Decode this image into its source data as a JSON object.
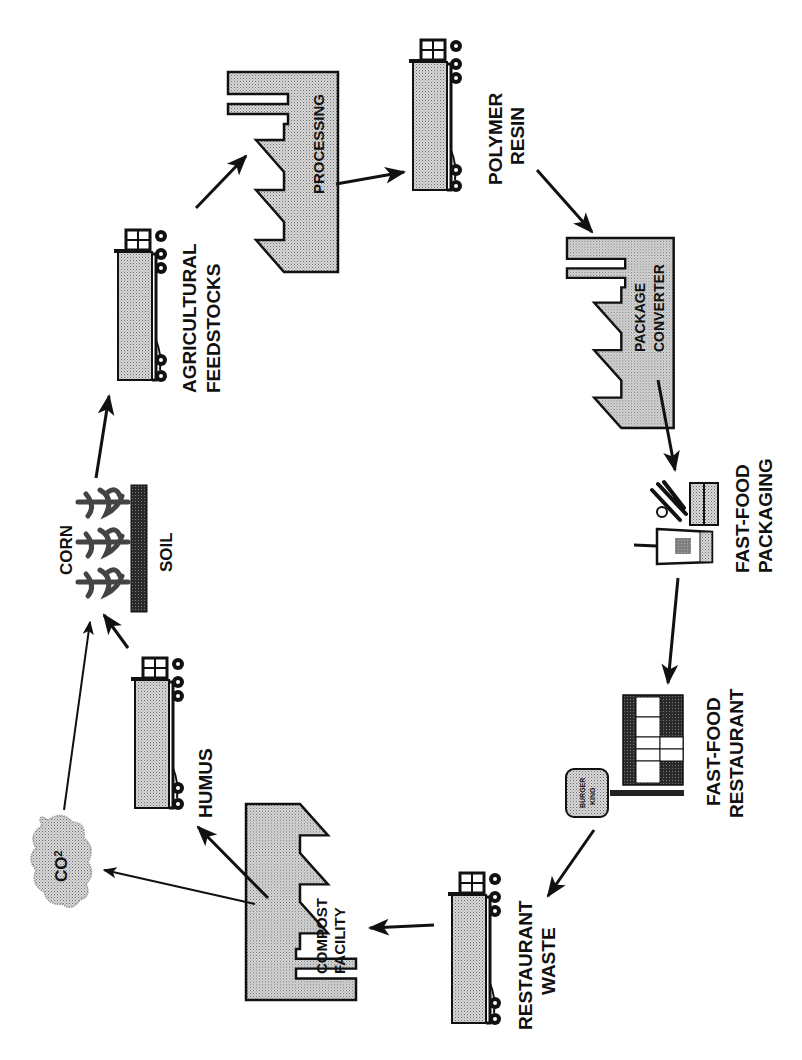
{
  "diagram": {
    "type": "cycle",
    "orientation": "rotated-90-ccw",
    "colors": {
      "stroke": "#111111",
      "fill_light": "#c8c8c8",
      "fill_dark": "#3a3a3a",
      "background": "#ffffff"
    },
    "nodes": [
      {
        "id": "corn",
        "label": "CORN",
        "icon": "corn-plants-icon"
      },
      {
        "id": "soil",
        "label": "SOIL",
        "icon": "soil-bar-icon"
      },
      {
        "id": "agricultural_feedstocks",
        "label_line1": "AGRICULTURAL",
        "label_line2": "FEEDSTOCKS",
        "icon": "truck-icon"
      },
      {
        "id": "processing",
        "label": "PROCESSING",
        "icon": "factory-icon"
      },
      {
        "id": "polymer_resin",
        "label_line1": "POLYMER",
        "label_line2": "RESIN",
        "icon": "truck-icon"
      },
      {
        "id": "package_converter",
        "label_line1": "PACKAGE",
        "label_line2": "CONVERTER",
        "icon": "factory-icon"
      },
      {
        "id": "fast_food_packaging",
        "label_line1": "FAST-FOOD",
        "label_line2": "PACKAGING",
        "icon": "cup-cutlery-box-icon"
      },
      {
        "id": "fast_food_restaurant",
        "label_line1": "FAST-FOOD",
        "label_line2": "RESTAURANT",
        "icon": "restaurant-building-icon",
        "sign_line1": "BURGER",
        "sign_line2": "KING"
      },
      {
        "id": "restaurant_waste",
        "label_line1": "RESTAURANT",
        "label_line2": "WASTE",
        "icon": "truck-icon"
      },
      {
        "id": "compost_facility",
        "label_line1": "COMPOST",
        "label_line2": "FACILITY",
        "icon": "factory-icon"
      },
      {
        "id": "humus",
        "label": "HUMUS",
        "icon": "truck-icon"
      },
      {
        "id": "co2",
        "label": "CO",
        "subscript": "2",
        "icon": "cloud-icon"
      }
    ],
    "edges": [
      {
        "from": "corn",
        "to": "agricultural_feedstocks"
      },
      {
        "from": "agricultural_feedstocks",
        "to": "processing"
      },
      {
        "from": "processing",
        "to": "polymer_resin"
      },
      {
        "from": "polymer_resin",
        "to": "package_converter"
      },
      {
        "from": "package_converter",
        "to": "fast_food_packaging"
      },
      {
        "from": "fast_food_packaging",
        "to": "fast_food_restaurant"
      },
      {
        "from": "fast_food_restaurant",
        "to": "restaurant_waste"
      },
      {
        "from": "restaurant_waste",
        "to": "compost_facility"
      },
      {
        "from": "compost_facility",
        "to": "humus"
      },
      {
        "from": "compost_facility",
        "to": "co2"
      },
      {
        "from": "humus",
        "to": "corn"
      },
      {
        "from": "co2",
        "to": "corn"
      }
    ]
  }
}
